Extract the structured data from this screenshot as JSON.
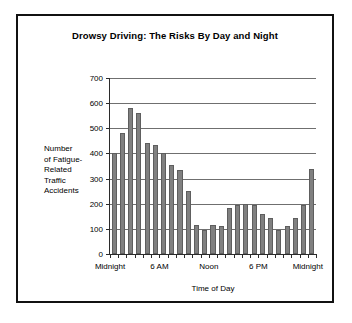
{
  "figure": {
    "title": "Drowsy Driving: The Risks By Day and Night",
    "frame_color": "#111111",
    "background_color": "#ffffff"
  },
  "axes": {
    "y_title_lines": [
      "Number",
      "of Fatigue-",
      "Related",
      "Traffic",
      "Accidents"
    ],
    "y_title": "Number of Fatigue-Related Traffic Accidents",
    "x_title": "Time of Day",
    "y_ticks": [
      "700",
      "600",
      "500",
      "400",
      "300",
      "200",
      "100",
      "0"
    ],
    "x_ticks": [
      "Midnight",
      "6 AM",
      "Noon",
      "6 PM",
      "Midnight"
    ]
  },
  "chart_data": {
    "type": "bar",
    "title": "Drowsy Driving: The Risks By Day and Night",
    "xlabel": "Time of Day",
    "ylabel": "Number of Fatigue-Related Traffic Accidents",
    "ylim": [
      0,
      700
    ],
    "yticks": [
      0,
      100,
      200,
      300,
      400,
      500,
      600,
      700
    ],
    "grid": "horizontal",
    "legend": "none",
    "bar_color": "#808080",
    "categories": [
      "Midnight",
      "1 AM",
      "2 AM",
      "3 AM",
      "4 AM",
      "5 AM",
      "6 AM",
      "7 AM",
      "8 AM",
      "9 AM",
      "10 AM",
      "11 AM",
      "Noon",
      "1 PM",
      "2 PM",
      "3 PM",
      "4 PM",
      "5 PM",
      "6 PM",
      "7 PM",
      "8 PM",
      "9 PM",
      "10 PM",
      "11 PM"
    ],
    "x_tick_positions": [
      0,
      6,
      12,
      18,
      24
    ],
    "x_tick_labels": [
      "Midnight",
      "6 AM",
      "Noon",
      "6 PM",
      "Midnight"
    ],
    "values": [
      400,
      480,
      580,
      560,
      440,
      435,
      400,
      355,
      335,
      250,
      115,
      95,
      115,
      110,
      185,
      195,
      200,
      195,
      160,
      145,
      95,
      110,
      145,
      195
    ],
    "final_value": 340
  }
}
